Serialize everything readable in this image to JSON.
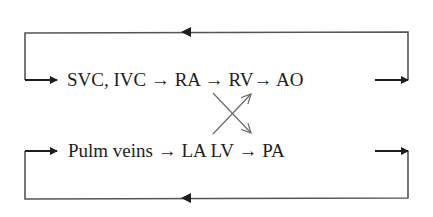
{
  "diagram": {
    "systemic_row": {
      "text": "SVC, IVC → RA → RV→ AO",
      "nodes": [
        "SVC, IVC",
        "RA",
        "RV",
        "AO"
      ]
    },
    "pulmonary_row": {
      "text": "Pulm veins → LA LV → PA",
      "nodes": [
        "Pulm veins",
        "LA LV",
        "PA"
      ]
    },
    "cross_arrows": [
      {
        "from": "RA/LA region",
        "to": "RV",
        "direction": "up-right"
      },
      {
        "from": "RA region",
        "to": "LV",
        "direction": "down-right"
      }
    ],
    "loops": [
      {
        "name": "top-loop",
        "direction": "AO back to SVC, IVC"
      },
      {
        "name": "bottom-loop",
        "direction": "PA back to Pulm veins"
      }
    ],
    "colors": {
      "line": "#2a2a2a",
      "cross": "#6a6a6a",
      "text": "#1e1e1e"
    }
  }
}
